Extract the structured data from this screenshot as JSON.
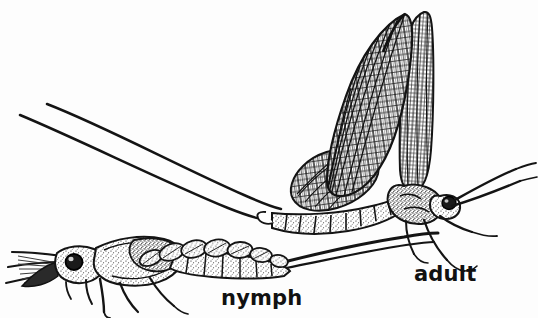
{
  "image": {
    "kind": "scientific-line-drawing",
    "subject": "mayfly (Ephemeroptera) life stages",
    "medium": "scanned black ink stipple and hatch engraving",
    "width": 538,
    "height": 318,
    "background_color": "#fdfdfd",
    "ink_color": "#111111"
  },
  "labels": [
    {
      "id": "nymph",
      "text": "nymph",
      "x": 221,
      "y": 288,
      "font_size": 21,
      "font_weight": "bold",
      "color": "#111111"
    },
    {
      "id": "adult",
      "text": "adult",
      "x": 414,
      "y": 264,
      "font_size": 21,
      "font_weight": "bold",
      "color": "#111111"
    }
  ],
  "figures": [
    {
      "id": "adult",
      "name": "adult mayfly",
      "orientation": "facing right, wings held upright",
      "parts": [
        "two upright forewings with dense polygonal cross-vein cells",
        "smaller rounded hindwing overlapping lower left",
        "segmented stippled abdomen angling down-left",
        "two long curving cerci sweeping to upper left",
        "thorax with legs",
        "head with large compound eye",
        "long forelegs extended forward to the right"
      ]
    },
    {
      "id": "nymph",
      "name": "mayfly nymph",
      "orientation": "facing left, body horizontal",
      "parts": [
        "head with large dark compound eye",
        "feathery mouthpart brushes and antennae pointing left",
        "stippled thorax with developing wing pads",
        "row of oval leaf-shaped abdominal gill plates",
        "legs extending downward",
        "tapering abdomen with caudal filaments to the right"
      ]
    }
  ]
}
